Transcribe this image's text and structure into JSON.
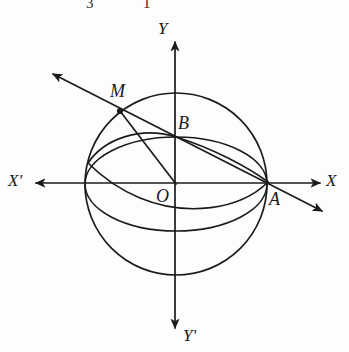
{
  "figure": {
    "kind": "geometry-diagram",
    "background_color": "#fdfdfd",
    "stroke_color": "#1b1b1b",
    "canvas": {
      "width": 349,
      "height": 352
    },
    "axes": {
      "x_axis": {
        "label_positive": "X",
        "label_negative": "X'",
        "y": 183,
        "x_start": 36,
        "x_end": 320
      },
      "y_axis": {
        "label_positive": "Y",
        "label_negative": "Y'",
        "x": 175,
        "y_start": 42,
        "y_end": 328
      }
    },
    "sphere": {
      "center_x": 176,
      "center_y": 184,
      "radius": 91
    },
    "equator": {
      "center_x": 176,
      "center_y": 184,
      "rx": 91,
      "ry": 47
    },
    "points": [
      {
        "name": "M",
        "x": 120,
        "y": 111,
        "has_dot": true
      },
      {
        "name": "B",
        "x": 175,
        "y": 137,
        "has_dot": false
      },
      {
        "name": "O",
        "x": 176,
        "y": 184,
        "has_dot": false
      },
      {
        "name": "A",
        "x": 270,
        "y": 183,
        "has_dot": false
      }
    ],
    "oblique_line": {
      "arrow_upper_left_x": 53,
      "arrow_upper_left_y": 74,
      "arrow_lower_right_x": 322,
      "arrow_lower_right_y": 211
    }
  },
  "labels": {
    "y_positive": "Y",
    "y_negative": "Y'",
    "x_positive": "X",
    "x_negative": "X'",
    "point_m": "M",
    "point_b": "B",
    "point_o": "O",
    "point_a": "A"
  },
  "cropped_top_text": {
    "left_fragment": "3",
    "right_fragment": "1"
  }
}
